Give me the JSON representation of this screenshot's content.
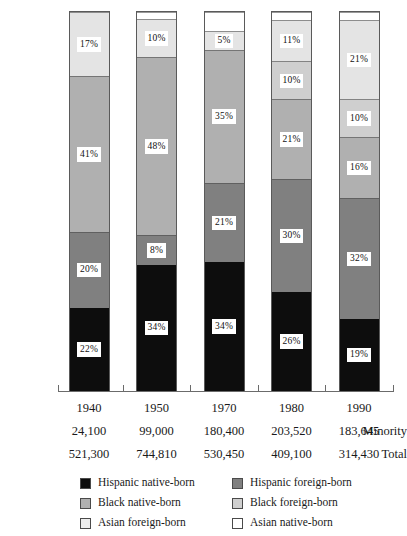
{
  "chart_data": {
    "type": "bar",
    "title": "",
    "subtitle": "",
    "xlabel": "",
    "ylabel": "",
    "stacked": true,
    "normalized_percent": true,
    "grid": false,
    "legend_position": "bottom",
    "ylim": [
      0,
      100
    ],
    "categories": [
      "1940",
      "1950",
      "1970",
      "1980",
      "1990"
    ],
    "series": [
      {
        "name": "Hispanic native-born",
        "color": "#0d0d0d",
        "values": [
          22,
          34,
          34,
          26,
          19
        ],
        "labels": [
          "22%",
          "34%",
          "34%",
          "26%",
          "19%"
        ]
      },
      {
        "name": "Hispanic foreign-born",
        "color": "#808080",
        "values": [
          20,
          8,
          21,
          30,
          32
        ],
        "labels": [
          "20%",
          "8%",
          "21%",
          "30%",
          "32%"
        ]
      },
      {
        "name": "Black native-born",
        "color": "#b0b0b0",
        "values": [
          41,
          48,
          35,
          21,
          16
        ],
        "labels": [
          "41%",
          "48%",
          "35%",
          "21%",
          "16%"
        ]
      },
      {
        "name": "Black foreign-born",
        "color": "#cfcfcf",
        "values": [
          0,
          0,
          0,
          10,
          10
        ],
        "labels": [
          "",
          "",
          "",
          "10%",
          "10%"
        ]
      },
      {
        "name": "Asian foreign-born",
        "color": "#e4e4e4",
        "values": [
          17,
          10,
          5,
          11,
          21
        ],
        "labels": [
          "17%",
          "10%",
          "5%",
          "11%",
          "21%"
        ]
      },
      {
        "name": "Asian native-born",
        "color": "#ffffff",
        "values": [
          0,
          2,
          5,
          2,
          2
        ],
        "labels": [
          "",
          "",
          "",
          "",
          ""
        ]
      }
    ]
  },
  "axis": {
    "years": [
      "1940",
      "1950",
      "1970",
      "1980",
      "1990"
    ]
  },
  "table": {
    "rows": [
      {
        "label": "Minority",
        "values": [
          "24,100",
          "99,000",
          "180,400",
          "203,520",
          "183,645"
        ]
      },
      {
        "label": "Total",
        "values": [
          "521,300",
          "744,810",
          "530,450",
          "409,100",
          "314,430"
        ]
      }
    ]
  },
  "legend": {
    "items": [
      {
        "label": "Hispanic native-born",
        "color": "#0d0d0d"
      },
      {
        "label": "Hispanic foreign-born",
        "color": "#808080"
      },
      {
        "label": "Black native-born",
        "color": "#b0b0b0"
      },
      {
        "label": "Black foreign-born",
        "color": "#cfcfcf"
      },
      {
        "label": "Asian foreign-born",
        "color": "#ededed"
      },
      {
        "label": "Asian native-born",
        "color": "#ffffff"
      }
    ]
  }
}
